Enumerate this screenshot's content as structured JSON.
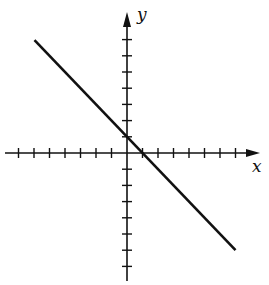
{
  "chart_data": {
    "type": "line",
    "title": "",
    "xlabel": "x",
    "ylabel": "y",
    "xlim": [
      -7,
      8
    ],
    "ylim": [
      -8,
      8
    ],
    "x_ticks_negative": [
      -7,
      -6,
      -5,
      -4,
      -3,
      -2,
      -1
    ],
    "x_ticks_positive": [
      1,
      2,
      3,
      4,
      5,
      6,
      7
    ],
    "y_ticks_positive": [
      1,
      2,
      3,
      4,
      5,
      6,
      7
    ],
    "y_ticks_negative": [
      -1,
      -2,
      -3,
      -4,
      -5,
      -6,
      -7
    ],
    "tick_labels_shown": false,
    "grid": false,
    "series": [
      {
        "name": "line",
        "equation": "y = -x + 1",
        "slope": -1,
        "y_intercept": 1,
        "x_intercept": 1,
        "x": [
          -6,
          7
        ],
        "y": [
          7,
          -6
        ]
      }
    ],
    "colors": {
      "axis": "#111111",
      "line": "#111111",
      "background": "#ffffff"
    }
  }
}
